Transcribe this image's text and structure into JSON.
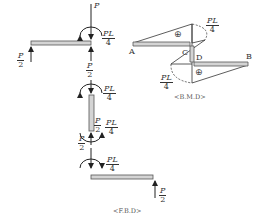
{
  "fbd": {
    "caption": "<F.B.D>",
    "loads": {
      "top_left_reaction": {
        "num": "P",
        "den": "2"
      },
      "top_applied_force": "P",
      "top_moment": {
        "num": "PL",
        "den": "4"
      },
      "top_right_reaction": {
        "num": "P",
        "den": "2"
      },
      "column_top_moment": {
        "num": "PL",
        "den": "4"
      },
      "column_bottom_force": {
        "num": "P",
        "den": "2"
      },
      "column_bottom_moment": {
        "num": "PL",
        "den": "4"
      },
      "lower_joint_force": {
        "num": "P",
        "den": "2"
      },
      "lower_joint_moment": {
        "num": "PL",
        "den": "4"
      },
      "bottom_right_reaction": {
        "num": "P",
        "den": "2"
      }
    }
  },
  "bmd": {
    "caption": "<B.M.D>",
    "points": {
      "a": "A",
      "b": "B",
      "c": "C",
      "d": "D"
    },
    "upper_moment": {
      "num": "PL",
      "den": "4"
    },
    "lower_moment": {
      "num": "PL",
      "den": "4"
    },
    "upper_sign": "⊕",
    "lower_sign": "⊕"
  },
  "colors": {
    "line": "#333333",
    "member_fill": "#d4d4d4",
    "member_stroke": "#555555"
  }
}
